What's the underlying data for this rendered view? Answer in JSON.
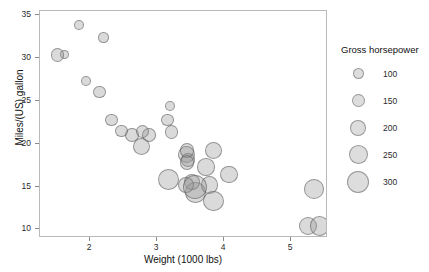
{
  "figure": {
    "background_color": "#ffffff",
    "panel_border_color": "#b9b9b9",
    "point_fill_color": "#969696",
    "point_stroke_color": "#5a5a5a"
  },
  "axes": {
    "x_title": "Weight (1000 lbs)",
    "y_title": "Miles/(US) gallon",
    "x_ticks": [
      "2",
      "3",
      "4",
      "5"
    ],
    "y_ticks": [
      "10",
      "15",
      "20",
      "25",
      "30",
      "35"
    ]
  },
  "legend": {
    "title": "Gross horsepower",
    "entries": [
      {
        "label": "100",
        "size_px": 11
      },
      {
        "label": "150",
        "size_px": 13
      },
      {
        "label": "200",
        "size_px": 16
      },
      {
        "label": "250",
        "size_px": 19
      },
      {
        "label": "300",
        "size_px": 22
      }
    ]
  },
  "chart_data": {
    "type": "scatter",
    "title": "",
    "xlabel": "Weight (1000 lbs)",
    "ylabel": "Miles/(US) gallon",
    "xlim": [
      1.25,
      5.55
    ],
    "ylim": [
      9.0,
      35.5
    ],
    "xticks": [
      2,
      3,
      4,
      5
    ],
    "yticks": [
      10,
      15,
      20,
      25,
      30,
      35
    ],
    "grid": false,
    "legend": {
      "title": "Gross horsepower",
      "position": "right",
      "size_breaks": [
        100,
        150,
        200,
        250,
        300
      ]
    },
    "size_encoding": "Gross horsepower (hp)",
    "points": [
      {
        "x": 2.62,
        "y": 21.0,
        "size": 110
      },
      {
        "x": 2.875,
        "y": 21.0,
        "size": 110
      },
      {
        "x": 2.32,
        "y": 22.8,
        "size": 93
      },
      {
        "x": 3.215,
        "y": 21.4,
        "size": 110
      },
      {
        "x": 3.44,
        "y": 18.7,
        "size": 175
      },
      {
        "x": 3.46,
        "y": 18.1,
        "size": 105
      },
      {
        "x": 3.57,
        "y": 14.3,
        "size": 245
      },
      {
        "x": 3.19,
        "y": 24.4,
        "size": 62
      },
      {
        "x": 3.15,
        "y": 22.8,
        "size": 95
      },
      {
        "x": 3.44,
        "y": 19.2,
        "size": 123
      },
      {
        "x": 3.44,
        "y": 17.8,
        "size": 123
      },
      {
        "x": 4.07,
        "y": 16.4,
        "size": 180
      },
      {
        "x": 3.73,
        "y": 17.3,
        "size": 180
      },
      {
        "x": 3.78,
        "y": 15.2,
        "size": 180
      },
      {
        "x": 5.25,
        "y": 10.4,
        "size": 205
      },
      {
        "x": 5.424,
        "y": 10.4,
        "size": 215
      },
      {
        "x": 5.345,
        "y": 14.7,
        "size": 230
      },
      {
        "x": 2.2,
        "y": 32.4,
        "size": 66
      },
      {
        "x": 1.615,
        "y": 30.4,
        "size": 52
      },
      {
        "x": 1.835,
        "y": 33.9,
        "size": 65
      },
      {
        "x": 2.465,
        "y": 21.5,
        "size": 97
      },
      {
        "x": 3.52,
        "y": 15.5,
        "size": 150
      },
      {
        "x": 3.435,
        "y": 15.2,
        "size": 150
      },
      {
        "x": 3.84,
        "y": 13.3,
        "size": 245
      },
      {
        "x": 3.845,
        "y": 19.2,
        "size": 175
      },
      {
        "x": 1.935,
        "y": 27.3,
        "size": 66
      },
      {
        "x": 2.14,
        "y": 26.0,
        "size": 91
      },
      {
        "x": 1.513,
        "y": 30.4,
        "size": 113
      },
      {
        "x": 3.17,
        "y": 15.8,
        "size": 264
      },
      {
        "x": 2.77,
        "y": 19.7,
        "size": 175
      },
      {
        "x": 3.57,
        "y": 15.0,
        "size": 335
      },
      {
        "x": 2.78,
        "y": 21.4,
        "size": 109
      }
    ]
  }
}
